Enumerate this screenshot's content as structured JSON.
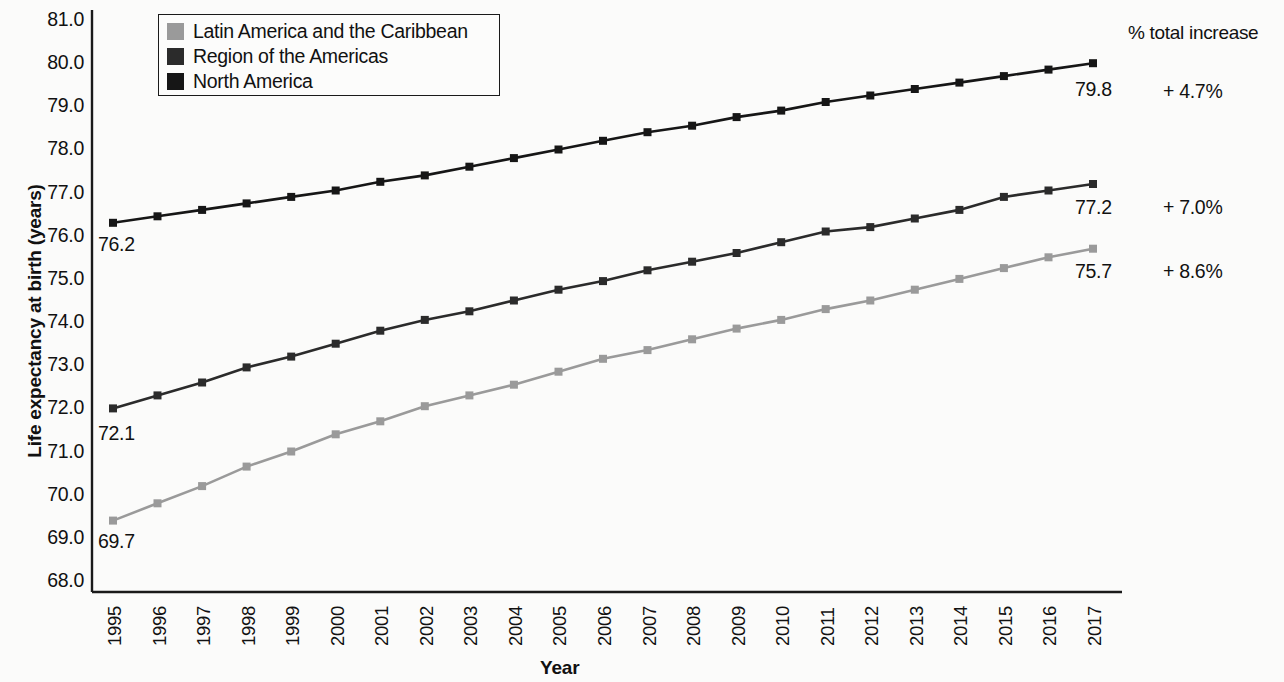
{
  "chart_data": {
    "type": "line",
    "title": "",
    "xlabel": "Year",
    "ylabel": "Life expectancy at birth (years)",
    "ylim": [
      68.0,
      81.0
    ],
    "ytick_step": 1.0,
    "grid": false,
    "legend_position": "top-left",
    "x": [
      1995,
      1996,
      1997,
      1998,
      1999,
      2000,
      2001,
      2002,
      2003,
      2004,
      2005,
      2006,
      2007,
      2008,
      2009,
      2010,
      2011,
      2012,
      2013,
      2014,
      2015,
      2016,
      2017
    ],
    "categories": [
      "1995",
      "1996",
      "1997",
      "1998",
      "1999",
      "2000",
      "2001",
      "2002",
      "2003",
      "2004",
      "2005",
      "2006",
      "2007",
      "2008",
      "2009",
      "2010",
      "2011",
      "2012",
      "2013",
      "2014",
      "2015",
      "2016",
      "2017"
    ],
    "yticks": [
      "68.0",
      "69.0",
      "70.0",
      "71.0",
      "72.0",
      "73.0",
      "74.0",
      "75.0",
      "76.0",
      "77.0",
      "78.0",
      "79.0",
      "80.0",
      "81.0"
    ],
    "series": [
      {
        "name": "North America",
        "color": "#161616",
        "marker": "square",
        "values": [
          76.3,
          76.45,
          76.6,
          76.75,
          76.9,
          77.05,
          77.25,
          77.4,
          77.6,
          77.8,
          78.0,
          78.2,
          78.4,
          78.55,
          78.75,
          78.9,
          79.1,
          79.25,
          79.4,
          79.55,
          79.7,
          79.85,
          80.0
        ],
        "start_label": "76.2",
        "end_label": "79.8",
        "total_increase": "+ 4.7%"
      },
      {
        "name": "Region of the Americas",
        "color": "#2b2b2b",
        "marker": "square",
        "values": [
          72.0,
          72.3,
          72.6,
          72.95,
          73.2,
          73.5,
          73.8,
          74.05,
          74.25,
          74.5,
          74.75,
          74.95,
          75.2,
          75.4,
          75.6,
          75.85,
          76.1,
          76.2,
          76.4,
          76.6,
          76.9,
          77.05,
          77.2
        ],
        "start_label": "72.1",
        "end_label": "77.2",
        "total_increase": "+ 7.0%"
      },
      {
        "name": "Latin America and the Caribbean",
        "color": "#9a9a9a",
        "marker": "square",
        "values": [
          69.4,
          69.8,
          70.2,
          70.65,
          71.0,
          71.4,
          71.7,
          72.05,
          72.3,
          72.55,
          72.85,
          73.15,
          73.35,
          73.6,
          73.85,
          74.05,
          74.3,
          74.5,
          74.75,
          75.0,
          75.25,
          75.5,
          75.7
        ],
        "start_label": "69.7",
        "end_label": "75.7",
        "total_increase": "+ 8.6%"
      }
    ]
  },
  "legend": {
    "items": [
      {
        "label": "Latin America and the Caribbean",
        "color": "#9a9a9a"
      },
      {
        "label": "Region of the Americas",
        "color": "#2b2b2b"
      },
      {
        "label": "North America",
        "color": "#161616"
      }
    ]
  },
  "right_column": {
    "header": "% total increase",
    "values": [
      "+ 4.7%",
      "+ 7.0%",
      "+ 8.6%"
    ]
  },
  "annotations": {
    "start_labels": [
      "76.2",
      "72.1",
      "69.7"
    ],
    "end_labels": [
      "79.8",
      "77.2",
      "75.7"
    ]
  },
  "axis": {
    "x_title": "Year",
    "y_title": "Life expectancy at birth (years)"
  }
}
